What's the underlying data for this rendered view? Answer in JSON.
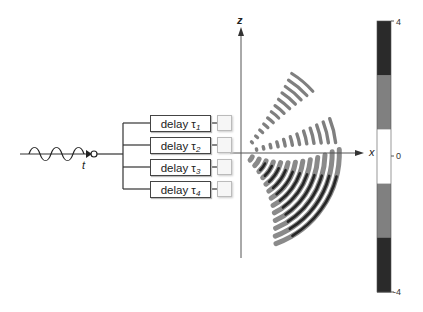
{
  "figure": {
    "source_label": "t",
    "delays": [
      {
        "text": "delay τ",
        "sub": "1"
      },
      {
        "text": "delay τ",
        "sub": "2"
      },
      {
        "text": "delay τ",
        "sub": "3"
      },
      {
        "text": "delay τ",
        "sub": "4"
      }
    ],
    "axes": {
      "x_label": "x",
      "z_label": "z"
    },
    "colorbar": {
      "max_label": "4",
      "mid_label": "0",
      "min_label": "-4",
      "levels": [
        "#2a2a2a",
        "#808080",
        "#ffffff",
        "#808080",
        "#2a2a2a"
      ]
    },
    "colors": {
      "dark": "#2a2a2a",
      "gray": "#7f7f7f",
      "line": "#333333"
    }
  }
}
